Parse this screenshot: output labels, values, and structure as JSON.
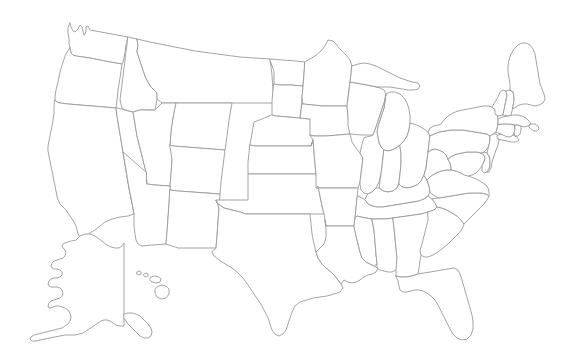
{
  "figure": {
    "kind": "map",
    "projection": "conic",
    "width": 568,
    "height": 363,
    "background_color": "#ffffff",
    "stroke_color": "#9a9a9a",
    "stroke_width": 0.9,
    "fill_color": "#ffffff",
    "has_labels": false,
    "has_legend": false,
    "has_title_text": false,
    "has_fill_shading": false,
    "insets": [
      "Alaska",
      "Hawaii"
    ],
    "inset_position": "lower-left"
  },
  "map_data": {
    "type": "choropleth-outline",
    "region_count": 51,
    "regions": [
      {
        "name": "Washington",
        "group": "contiguous"
      },
      {
        "name": "Oregon",
        "group": "contiguous"
      },
      {
        "name": "California",
        "group": "contiguous"
      },
      {
        "name": "Nevada",
        "group": "contiguous"
      },
      {
        "name": "Idaho",
        "group": "contiguous"
      },
      {
        "name": "Montana",
        "group": "contiguous"
      },
      {
        "name": "Wyoming",
        "group": "contiguous"
      },
      {
        "name": "Utah",
        "group": "contiguous"
      },
      {
        "name": "Arizona",
        "group": "contiguous"
      },
      {
        "name": "Colorado",
        "group": "contiguous"
      },
      {
        "name": "New Mexico",
        "group": "contiguous"
      },
      {
        "name": "North Dakota",
        "group": "contiguous"
      },
      {
        "name": "South Dakota",
        "group": "contiguous"
      },
      {
        "name": "Nebraska",
        "group": "contiguous"
      },
      {
        "name": "Kansas",
        "group": "contiguous"
      },
      {
        "name": "Oklahoma",
        "group": "contiguous"
      },
      {
        "name": "Texas",
        "group": "contiguous"
      },
      {
        "name": "Minnesota",
        "group": "contiguous"
      },
      {
        "name": "Iowa",
        "group": "contiguous"
      },
      {
        "name": "Missouri",
        "group": "contiguous"
      },
      {
        "name": "Arkansas",
        "group": "contiguous"
      },
      {
        "name": "Louisiana",
        "group": "contiguous"
      },
      {
        "name": "Wisconsin",
        "group": "contiguous"
      },
      {
        "name": "Illinois",
        "group": "contiguous"
      },
      {
        "name": "Michigan",
        "group": "contiguous"
      },
      {
        "name": "Indiana",
        "group": "contiguous"
      },
      {
        "name": "Ohio",
        "group": "contiguous"
      },
      {
        "name": "Kentucky",
        "group": "contiguous"
      },
      {
        "name": "Tennessee",
        "group": "contiguous"
      },
      {
        "name": "Mississippi",
        "group": "contiguous"
      },
      {
        "name": "Alabama",
        "group": "contiguous"
      },
      {
        "name": "Georgia",
        "group": "contiguous"
      },
      {
        "name": "Florida",
        "group": "contiguous"
      },
      {
        "name": "South Carolina",
        "group": "contiguous"
      },
      {
        "name": "North Carolina",
        "group": "contiguous"
      },
      {
        "name": "Virginia",
        "group": "contiguous"
      },
      {
        "name": "West Virginia",
        "group": "contiguous"
      },
      {
        "name": "Maryland",
        "group": "contiguous"
      },
      {
        "name": "Delaware",
        "group": "contiguous"
      },
      {
        "name": "Pennsylvania",
        "group": "contiguous"
      },
      {
        "name": "New Jersey",
        "group": "contiguous"
      },
      {
        "name": "New York",
        "group": "contiguous"
      },
      {
        "name": "Connecticut",
        "group": "contiguous"
      },
      {
        "name": "Rhode Island",
        "group": "contiguous"
      },
      {
        "name": "Massachusetts",
        "group": "contiguous"
      },
      {
        "name": "Vermont",
        "group": "contiguous"
      },
      {
        "name": "New Hampshire",
        "group": "contiguous"
      },
      {
        "name": "Maine",
        "group": "contiguous"
      },
      {
        "name": "Alaska",
        "group": "inset"
      },
      {
        "name": "Hawaii",
        "group": "inset"
      },
      {
        "name": "District of Columbia",
        "group": "contiguous"
      }
    ]
  }
}
